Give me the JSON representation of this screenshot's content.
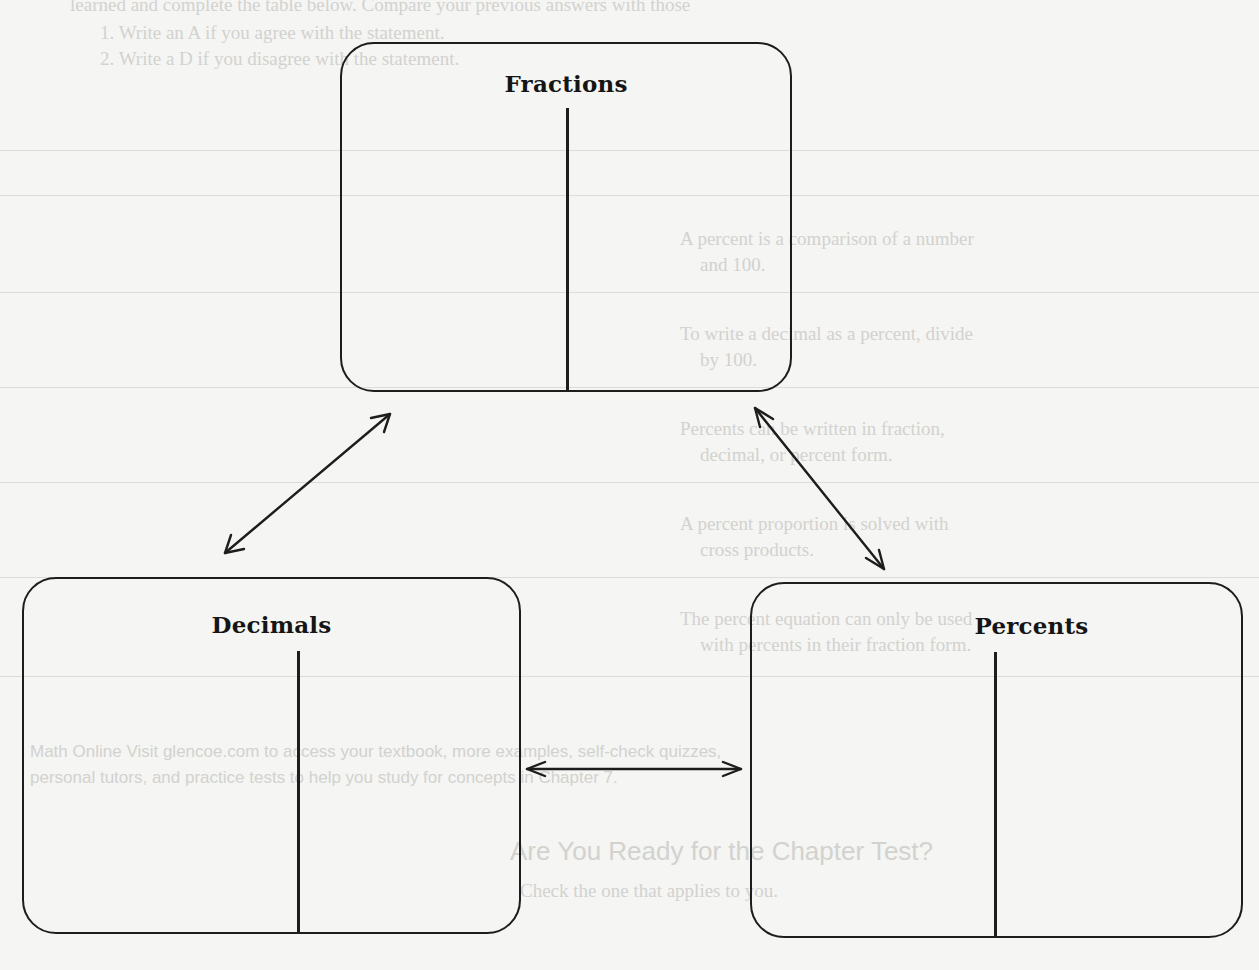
{
  "diagram": {
    "type": "concept-map",
    "nodes": [
      {
        "id": "fractions",
        "title": "Fractions"
      },
      {
        "id": "decimals",
        "title": "Decimals"
      },
      {
        "id": "percents",
        "title": "Percents"
      }
    ],
    "edges": [
      {
        "from": "fractions",
        "to": "decimals",
        "style": "double-arrow"
      },
      {
        "from": "fractions",
        "to": "percents",
        "style": "double-arrow"
      },
      {
        "from": "decimals",
        "to": "percents",
        "style": "double-arrow"
      }
    ],
    "colors": {
      "ink": "#1d1d1d",
      "paper": "#f5f5f3",
      "bleed_through": "#d2d2cf"
    }
  },
  "background_bleed": {
    "lines": [
      "learned and complete the table below. Compare your previous answers with those",
      "1. Write an A if you agree with the statement.",
      "2. Write a D if you disagree with the statement.",
      "A percent is a comparison of a number",
      "and 100.",
      "To write a decimal as a percent, divide",
      "by 100.",
      "Percents can be written in fraction,",
      "decimal, or percent form.",
      "A percent proportion is solved with",
      "cross products.",
      "The percent equation can only be used",
      "with percents in their fraction form.",
      "Math Online Visit glencoe.com to access your textbook, more examples, self-check quizzes,",
      "personal tutors, and practice tests to help you study for concepts in Chapter 7.",
      "Are You Ready for the Chapter Test?",
      "Check the one that applies to you."
    ]
  }
}
